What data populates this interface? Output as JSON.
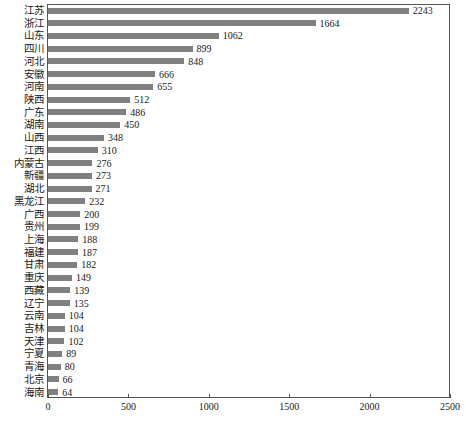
{
  "chart_data": {
    "type": "bar",
    "orientation": "horizontal",
    "title": "",
    "xlabel": "",
    "ylabel": "",
    "xlim": [
      0,
      2500
    ],
    "xticks": [
      "0",
      "500",
      "1000",
      "1500",
      "2000",
      "2500"
    ],
    "grid": false,
    "legend": null,
    "bar_color": "#808080",
    "frame_color": "#555555",
    "categories": [
      "江苏",
      "浙江",
      "山东",
      "四川",
      "河北",
      "安徽",
      "河南",
      "陕西",
      "广东",
      "湖南",
      "山西",
      "江西",
      "内蒙古",
      "新疆",
      "湖北",
      "黑龙江",
      "广西",
      "贵州",
      "上海",
      "福建",
      "甘肃",
      "重庆",
      "西藏",
      "辽宁",
      "云南",
      "吉林",
      "天津",
      "宁夏",
      "青海",
      "北京",
      "海南"
    ],
    "values": [
      2243,
      1664,
      1062,
      899,
      848,
      666,
      655,
      512,
      486,
      450,
      348,
      310,
      276,
      273,
      271,
      232,
      200,
      199,
      188,
      187,
      182,
      149,
      139,
      135,
      104,
      104,
      102,
      89,
      80,
      66,
      64
    ],
    "value_labels": [
      "2243",
      "1664",
      "1062",
      "899",
      "848",
      "666",
      "655",
      "512",
      "486",
      "450",
      "348",
      "310",
      "276",
      "273",
      "271",
      "232",
      "200",
      "199",
      "188",
      "187",
      "182",
      "149",
      "139",
      "135",
      "104",
      "104",
      "102",
      "89",
      "80",
      "66",
      "64"
    ]
  }
}
